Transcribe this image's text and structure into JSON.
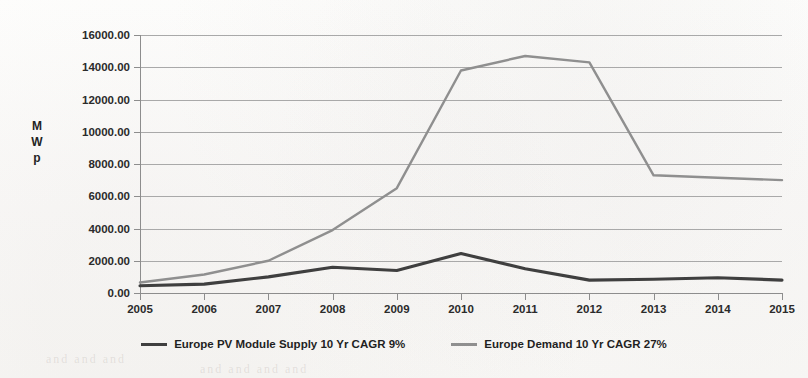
{
  "chart_data": {
    "type": "line",
    "title": "",
    "xlabel": "",
    "ylabel": "MWp",
    "ylabel_stacked": [
      "M",
      "W",
      "p"
    ],
    "categories": [
      "2005",
      "2006",
      "2007",
      "2008",
      "2009",
      "2010",
      "2011",
      "2012",
      "2013",
      "2014",
      "2015"
    ],
    "ylim": [
      0,
      16000
    ],
    "ytick_values": [
      0,
      2000,
      4000,
      6000,
      8000,
      10000,
      12000,
      14000,
      16000
    ],
    "ytick_labels": [
      "0.00",
      "2000.00",
      "4000.00",
      "6000.00",
      "8000.00",
      "10000.00",
      "12000.00",
      "14000.00",
      "16000.00"
    ],
    "grid": true,
    "legend_position": "bottom",
    "series": [
      {
        "name": "Europe PV Module Supply 10 Yr CAGR 9%",
        "color": "#3f3f3f",
        "values": [
          450,
          550,
          1000,
          1600,
          1400,
          2450,
          1500,
          800,
          850,
          950,
          800
        ]
      },
      {
        "name": "Europe Demand 10 Yr CAGR 27%",
        "color": "#8f8f8f",
        "values": [
          650,
          1150,
          2000,
          3900,
          6500,
          13800,
          14700,
          14300,
          7300,
          7150,
          7000
        ]
      }
    ]
  },
  "legend": {
    "items": [
      {
        "label": "Europe PV Module Supply 10 Yr CAGR 9%",
        "color": "#3f3f3f"
      },
      {
        "label": "Europe Demand 10 Yr CAGR 27%",
        "color": "#8f8f8f"
      }
    ]
  },
  "page_artifacts": {
    "bleed_left": "and and and",
    "bleed_right": "and and and and"
  }
}
